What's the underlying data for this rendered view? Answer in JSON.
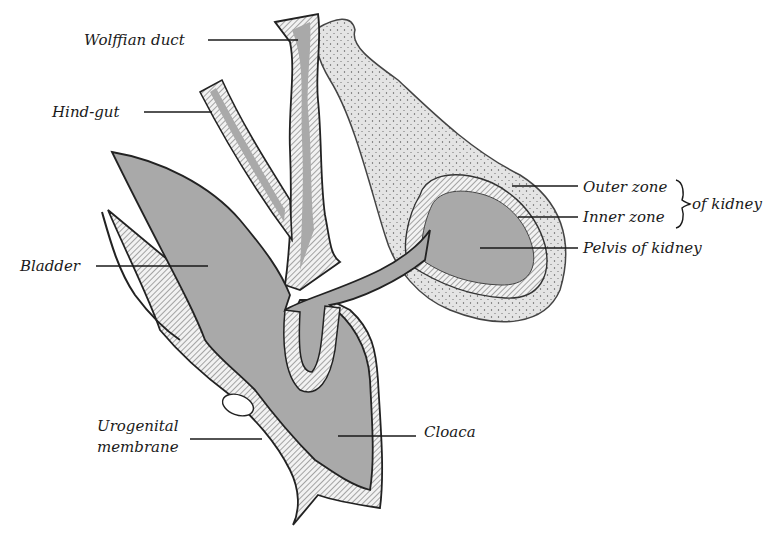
{
  "figure": {
    "labels": {
      "wolffian_duct": "Wolffian duct",
      "hind_gut": "Hind-gut",
      "bladder": "Bladder",
      "outer_zone": "Outer zone",
      "inner_zone": "Inner zone",
      "of_kidney": "of kidney",
      "pelvis_of_kidney": "Pelvis of kidney",
      "urogenital_line1": "Urogenital",
      "urogenital_line2": "membrane",
      "cloaca": "Cloaca"
    },
    "colors": {
      "lumen": "#a9a9a9",
      "epithelium": "#e9e9e9",
      "kidney_tissue": "#d8d8d8",
      "ink": "#1a1a1a"
    }
  }
}
